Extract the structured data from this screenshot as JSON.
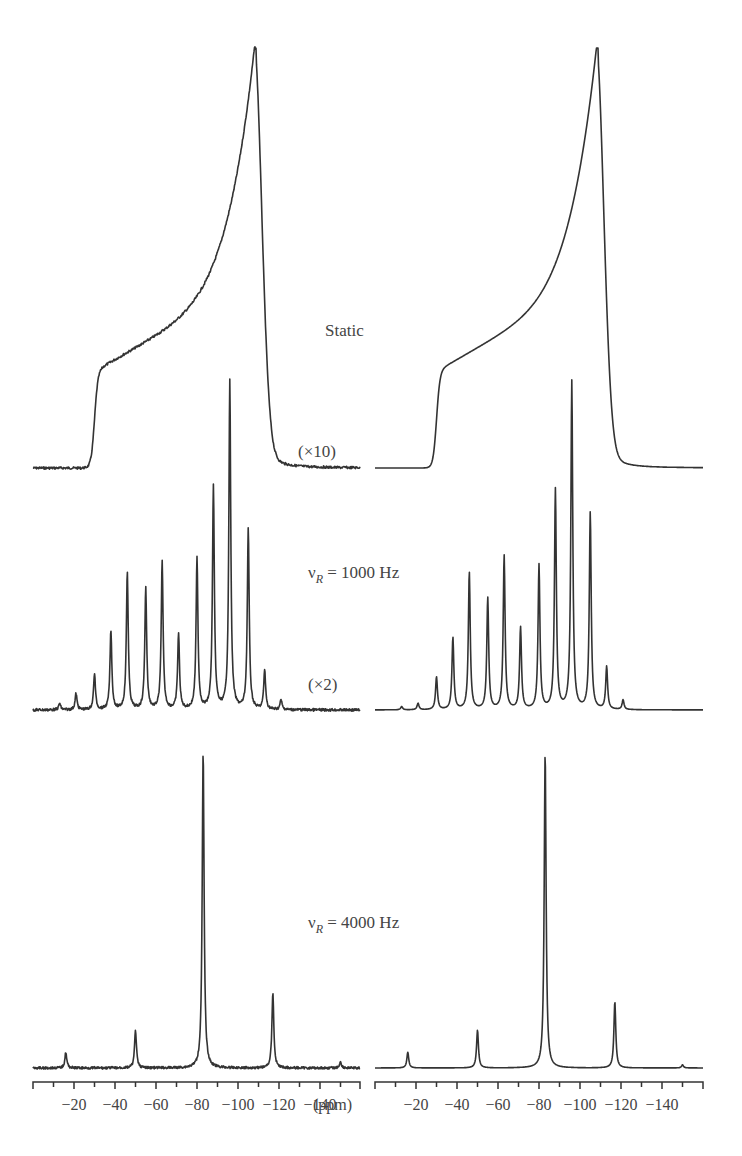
{
  "chart_data": {
    "type": "line",
    "title": "",
    "xlabel": "(ppm)",
    "ylabel": "",
    "x_direction": "decreasing (0 to -160 ppm, left to right)",
    "panels": [
      {
        "name": "left",
        "description": "Experimental spectra",
        "xlim": [
          0,
          -160
        ],
        "ticks": [
          -20,
          -40,
          -60,
          -80,
          -100,
          -120,
          -140
        ]
      },
      {
        "name": "right",
        "description": "Simulated spectra",
        "xlim": [
          0,
          -160
        ],
        "ticks": [
          -20,
          -40,
          -60,
          -80,
          -100,
          -120,
          -140
        ]
      }
    ],
    "rows": [
      {
        "label": "Static",
        "scale_annotation": "(×10)",
        "shape": "chemical shift anisotropy powder pattern",
        "powder_edge_ppm": -30,
        "shoulder_ppm": -35,
        "peak_ppm": -108,
        "upper_edge_ppm": -115
      },
      {
        "label": "νR = 1000 Hz",
        "scale_annotation": "(×2)",
        "sideband_spacing_ppm": 8.3,
        "peaks_ppm": [
          -13,
          -21,
          -30,
          -38,
          -46,
          -55,
          -63,
          -71,
          -80,
          -88,
          -96,
          -105,
          -113,
          -121
        ],
        "left_relative_heights": [
          0.02,
          0.05,
          0.11,
          0.24,
          0.42,
          0.37,
          0.45,
          0.23,
          0.46,
          0.68,
          1.0,
          0.55,
          0.12,
          0.03
        ],
        "right_relative_heights": [
          0.01,
          0.02,
          0.1,
          0.22,
          0.42,
          0.34,
          0.47,
          0.25,
          0.44,
          0.67,
          1.0,
          0.6,
          0.13,
          0.03
        ]
      },
      {
        "label": "νR = 4000 Hz",
        "sideband_spacing_ppm": 33,
        "peaks_ppm": [
          -16,
          -50,
          -83,
          -117,
          -150
        ],
        "left_relative_heights": [
          0.05,
          0.12,
          1.0,
          0.24,
          0.02
        ],
        "right_relative_heights": [
          0.05,
          0.12,
          1.0,
          0.21,
          0.01
        ]
      }
    ],
    "annotations": [
      "Static",
      "(×10)",
      "νR = 1000 Hz",
      "(×2)",
      "νR = 4000 Hz"
    ],
    "grid": false,
    "legend": null
  },
  "labels": {
    "static": "Static",
    "x10": "(×10)",
    "vr1000_prefix": "ν",
    "vr1000_sub": "R",
    "vr1000_suffix": " = 1000 Hz",
    "x2": "(×2)",
    "vr4000_prefix": "ν",
    "vr4000_sub": "R",
    "vr4000_suffix": " = 4000 Hz",
    "unit": "(ppm)"
  },
  "axis": {
    "tick_labels": [
      "−20",
      "−40",
      "−60",
      "−80",
      "−100",
      "−120",
      "−140"
    ]
  }
}
